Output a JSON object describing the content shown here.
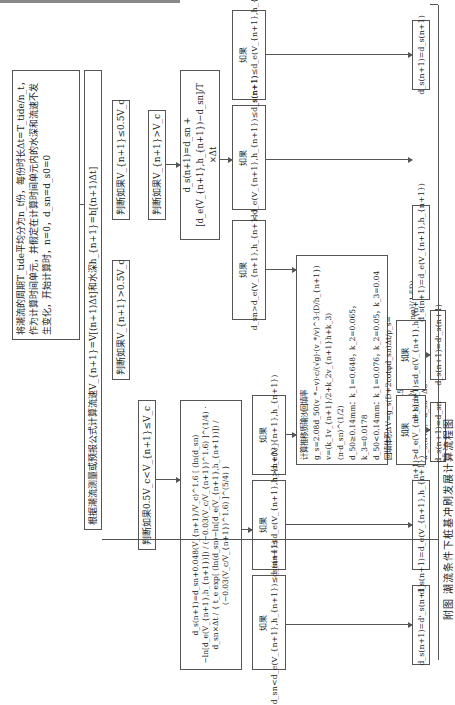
{
  "caption": "附图   潮流条件下桩基冲刷发展计算流程图",
  "boxes": {
    "init": "将潮流的周期T_tide平均分为n_t份，每份时长Δt=T_tide/n_t，作为计算时间单元，并假定在计算时间单元内的水深和流速不发生变化，开始计算时，n=0，d_sn=d_s0=0",
    "predict": "根据潮流测量或预报公式计算流速V_{n+1}=V[(n+1)Δt]和水深h_{n+1}=h[(n+1)Δt]",
    "cond_low": "判断如果V_{n+1}≤0.5V_c",
    "cond_mid": "判断如果0.5V_c<V_{n+1}≤V_c",
    "cond_mid_branch": "判断如果V_{n+1}>0.5V_c",
    "cond_high": "判断如果V_{n+1}>V_c",
    "formula_clear_water": "d_s(n+1)=d_sn+0.048(V_{n+1}/V_c)^1.6 [ (ln(d_sn)−ln[d_e(V_{n+1},h_{n+1})]) / (−0.03(V_c/V_{n+1})^1.6) ]^(1/4) · d_sn×Δt / { t_e exp[ (ln(d_sn)−ln[d_e(V_{n+1},h_{n+1})]) / (−0.03(V_c/V_{n+1})^1.6) ]^(5/4) }",
    "formula_live_bed": "d_s(n+1)=d_sn + [d_e(V_{n+1},h_{n+1})−d_sn]/T ×Δt",
    "if_a1": "如果 d_sn<d_e(V_{n+1},h_{n+1})≤d_s(n+1)",
    "if_a2": "如果 d_sn<d_s(n+1)≤d_e(V_{n+1},h_{n+1})",
    "if_a3": "如果 d_sn>d_e(V_{n+1},h_{n+1})",
    "if_b1": "如果 d_sn>d_e(V_{n+1},h_{n+1})",
    "if_b2": "如果 d_sn<d_e(V_{n+1},h_{n+1})≤d_s(n+1)",
    "if_b3": "如果 d_sn<d_s(n+1)≤d_e(V_{n+1},h_{n+1})",
    "backfill": {
      "line1": "计算推移质输沙回填率g_s=2.08d_50(v_*−v)·c/(√g)·(v_*/v)^3·(D/h_{n+1})",
      "line2": "v=(k_1v_{n+1}/2+k_2v_{n+1}h+k_3)(π·d_sn)^(1/2)",
      "line3": "d_50≥0.14mm：k_1=0.648，k_2=0.065，k_3=0.0178",
      "line4": "d_50<0.14mm：k_1=0.076，k_2=0.05，k_3=0.04",
      "line5": "回填体积ΔV=g_s(D+2cotφd_sn)Δt/ρ_s=(cotφ)²ΔS²(ΔS+1.5D)",
      "line6": "ΔS为小量，略去高阶小量，得ΔS=√(ΔV(tanφ)²/1.5D)",
      "line7": "d'_s(n+1)=d_sn−ΔS"
    },
    "if_c1": "如果 d'_s(n+1)>d_e(V_{n+1},h_{n+1})",
    "if_c2": "如果 d'_s(n+1)≤d_e(V_{n+1},h_{n+1})",
    "res_1": "d_s(n+1)=d'_s(n+1)",
    "res_2": "d_s(n+1)=d_e(V_{n+1},h_{n+1})",
    "res_3": "d_s(n+1)=d_sn",
    "res_4": "d_s(n+1)=d'_s(n+1)",
    "res_5": "d_s(n+1)=d_e(V_{n+1},h_{n+1})",
    "res_6": "d_s(n+1)=d_s(n+1)"
  }
}
